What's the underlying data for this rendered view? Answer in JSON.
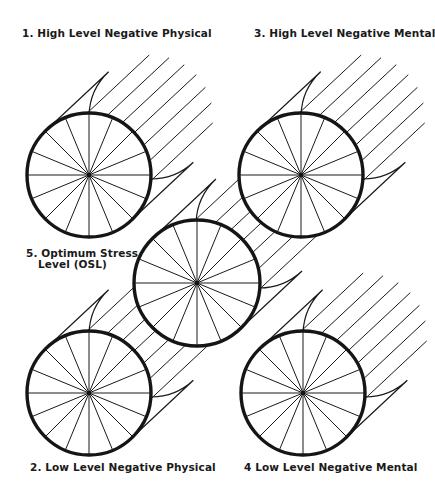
{
  "figure": {
    "background": "#ffffff",
    "ink_color": "#1a1a1a",
    "spokes_per_wheel": 16,
    "cylinder_offset": {
      "dx": 62,
      "dy": -58
    }
  },
  "labels": {
    "wheel1": "1. High Level Negative Physical",
    "wheel2": "2. Low Level Negative Physical",
    "wheel3": "3. High Level Negative Mental",
    "wheel4": "4 Low Level Negative Mental",
    "wheel5_line1": "5. Optimum Stress",
    "wheel5_line2": "Level (OSL)"
  },
  "wheels": [
    {
      "id": "wheel5",
      "name": "Optimum Stress Level (OSL)",
      "cx": 197,
      "cy": 283,
      "r": 63,
      "hatch_count": 6
    },
    {
      "id": "wheel1",
      "name": "High Level Negative Physical",
      "cx": 89,
      "cy": 175,
      "r": 62,
      "hatch_count": 6
    },
    {
      "id": "wheel3",
      "name": "High Level Negative Mental",
      "cx": 301,
      "cy": 175,
      "r": 62,
      "hatch_count": 6
    },
    {
      "id": "wheel2",
      "name": "Low Level Negative Physical",
      "cx": 89,
      "cy": 393,
      "r": 62,
      "hatch_count": 6
    },
    {
      "id": "wheel4",
      "name": "Low Level Negative Mental",
      "cx": 303,
      "cy": 393,
      "r": 62,
      "hatch_count": 6
    }
  ]
}
